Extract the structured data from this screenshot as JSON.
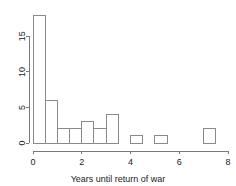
{
  "chart_data": {
    "type": "bar",
    "title": "",
    "subtitle": "",
    "xlabel": "Years until return of war",
    "ylabel": "",
    "bin_width": 0.5,
    "bin_starts": [
      0,
      0.5,
      1,
      1.5,
      2,
      2.5,
      3,
      3.5,
      4,
      4.5,
      5,
      5.5,
      6,
      6.5,
      7
    ],
    "categories": [
      "0-0.5",
      "0.5-1",
      "1-1.5",
      "1.5-2",
      "2-2.5",
      "2.5-3",
      "3-3.5",
      "3.5-4",
      "4-4.5",
      "4.5-5",
      "5-5.5",
      "5.5-6",
      "6-6.5",
      "6.5-7",
      "7-7.5"
    ],
    "values": [
      18,
      6,
      2,
      2,
      3,
      2,
      4,
      0,
      1,
      0,
      1,
      0,
      0,
      0,
      2
    ],
    "xlim": [
      0,
      8
    ],
    "ylim": [
      0,
      18
    ],
    "xticks": [
      0,
      2,
      4,
      6,
      8
    ],
    "xtick_labels": [
      "0",
      "2",
      "4",
      "6",
      "8"
    ],
    "yticks": [
      0,
      5,
      10,
      15
    ],
    "ytick_labels": [
      "0",
      "5",
      "10",
      "15"
    ],
    "grid": false,
    "legend": null,
    "bar_stroke": "#8a8a8a",
    "bar_fill": "none",
    "axis_color": "#7a7a7a"
  }
}
